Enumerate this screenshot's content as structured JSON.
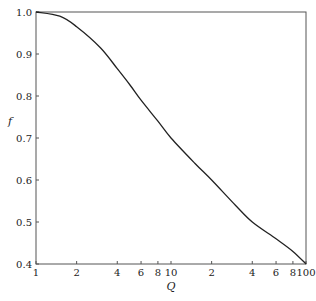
{
  "chart_data": {
    "type": "line",
    "title": "",
    "xlabel": "Q",
    "ylabel": "f",
    "xscale": "log",
    "xlim": [
      1,
      100
    ],
    "ylim": [
      0.4,
      1.0
    ],
    "grid": false,
    "legend": null,
    "x_ticks": [
      {
        "value": 1,
        "label": "1"
      },
      {
        "value": 2,
        "label": "2"
      },
      {
        "value": 4,
        "label": "4"
      },
      {
        "value": 6,
        "label": "6"
      },
      {
        "value": 8,
        "label": "8"
      },
      {
        "value": 10,
        "label": "10"
      },
      {
        "value": 20,
        "label": "2"
      },
      {
        "value": 40,
        "label": "4"
      },
      {
        "value": 60,
        "label": "6"
      },
      {
        "value": 80,
        "label": "8"
      },
      {
        "value": 100,
        "label": "100"
      }
    ],
    "y_ticks": [
      {
        "value": 1.0,
        "label": "1.0"
      },
      {
        "value": 0.9,
        "label": "0.9"
      },
      {
        "value": 0.8,
        "label": "0.8"
      },
      {
        "value": 0.7,
        "label": "0.7"
      },
      {
        "value": 0.6,
        "label": "0.6"
      },
      {
        "value": 0.5,
        "label": "0.5"
      },
      {
        "value": 0.4,
        "label": "0.4"
      }
    ],
    "series": [
      {
        "name": "f(Q)",
        "color": "#222222",
        "x": [
          1,
          1.5,
          2,
          3,
          4,
          5,
          6,
          8,
          10,
          15,
          20,
          30,
          40,
          60,
          80,
          100
        ],
        "y": [
          1.0,
          0.99,
          0.965,
          0.915,
          0.865,
          0.825,
          0.79,
          0.74,
          0.7,
          0.64,
          0.6,
          0.54,
          0.5,
          0.46,
          0.43,
          0.4
        ]
      }
    ]
  }
}
